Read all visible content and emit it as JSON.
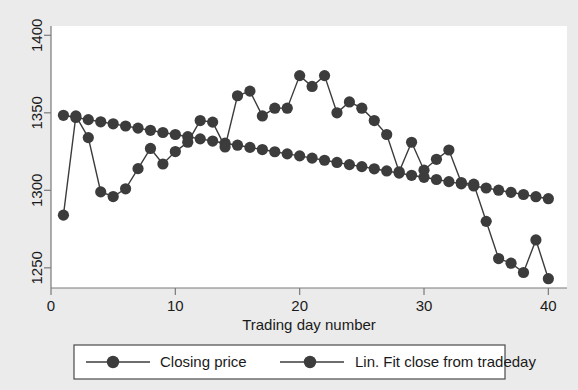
{
  "chart_data": {
    "type": "line",
    "title": "",
    "xlabel": "Trading day number",
    "ylabel": "",
    "xlim": [
      0,
      41.5
    ],
    "ylim": [
      1237,
      1406
    ],
    "xticks": [
      0,
      10,
      20,
      30,
      40
    ],
    "yticks": [
      1250,
      1300,
      1350,
      1400
    ],
    "grid": false,
    "legend_position": "bottom",
    "marker": "filled-circle",
    "series_color": "#3c3c3c",
    "x": [
      1,
      2,
      3,
      4,
      5,
      6,
      7,
      8,
      9,
      10,
      11,
      12,
      13,
      14,
      15,
      16,
      17,
      18,
      19,
      20,
      21,
      22,
      23,
      24,
      25,
      26,
      27,
      28,
      29,
      30,
      31,
      32,
      33,
      34,
      35,
      36,
      37,
      38,
      39,
      40
    ],
    "series": [
      {
        "name": "Closing price",
        "values": [
          1284,
          1348,
          1334,
          1299,
          1296,
          1301,
          1314,
          1327,
          1317,
          1325,
          1331,
          1345,
          1344,
          1328,
          1361,
          1364,
          1348,
          1353,
          1353,
          1374,
          1367,
          1374,
          1350,
          1357,
          1353,
          1345,
          1336,
          1312,
          1331,
          1313,
          1320,
          1326,
          1305,
          1304,
          1280,
          1256,
          1253,
          1247,
          1268,
          1243
        ]
      },
      {
        "name": "Lin. Fit close from tradeday",
        "values": [
          1348.4,
          1347.0,
          1345.6,
          1344.2,
          1342.9,
          1341.5,
          1340.1,
          1338.7,
          1337.3,
          1336.0,
          1334.6,
          1333.2,
          1331.8,
          1330.4,
          1329.1,
          1327.7,
          1326.3,
          1324.9,
          1323.5,
          1322.2,
          1320.8,
          1319.4,
          1318.0,
          1316.6,
          1315.3,
          1313.9,
          1312.5,
          1311.1,
          1309.7,
          1308.4,
          1307.0,
          1305.6,
          1304.2,
          1302.8,
          1301.5,
          1300.1,
          1298.7,
          1297.3,
          1295.9,
          1294.6
        ]
      }
    ]
  },
  "axis": {
    "x_label": "Trading day number",
    "x_tick_labels": [
      "0",
      "10",
      "20",
      "30",
      "40"
    ],
    "y_tick_labels": [
      "1250",
      "1300",
      "1350",
      "1400"
    ]
  },
  "legend": {
    "entries": [
      {
        "label": "Closing price"
      },
      {
        "label": "Lin. Fit close from tradeday"
      }
    ]
  },
  "colors": {
    "background": "#ebebeb",
    "plot_background": "#ffffff",
    "series": "#3c3c3c",
    "axis": "#6e6e6e",
    "text": "#1a1a1a"
  }
}
